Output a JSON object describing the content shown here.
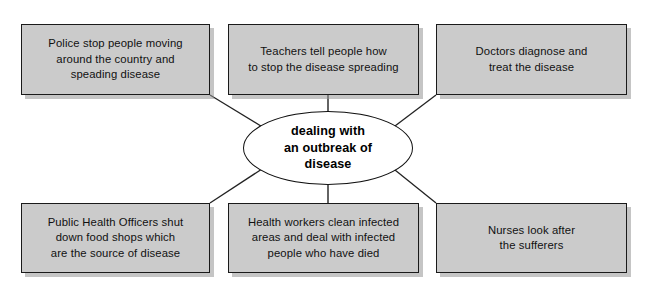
{
  "diagram": {
    "title": "dealing with an outbreak of disease",
    "type": "spider-diagram",
    "center": {
      "label": "dealing with\nan outbreak of\ndisease"
    },
    "colors": {
      "box_fill": "#cbcbcb",
      "box_border": "#1a1a1a",
      "center_fill": "#ffffff",
      "connector": "#222222",
      "page_background": "#ffffff",
      "shadow": "#969696"
    },
    "nodes": [
      {
        "id": "police",
        "label": "Police stop people moving\naround the country and\nspeading disease",
        "position": "top-left"
      },
      {
        "id": "teachers",
        "label": "Teachers tell people how\nto stop the disease spreading",
        "position": "top-center"
      },
      {
        "id": "doctors",
        "label": "Doctors diagnose and\ntreat the disease",
        "position": "top-right"
      },
      {
        "id": "public-health-officers",
        "label": "Public Health Officers shut\ndown food shops which\nare the source of disease",
        "position": "bottom-left"
      },
      {
        "id": "health-workers",
        "label": "Health workers clean infected\nareas and deal with infected\npeople who have died",
        "position": "bottom-center"
      },
      {
        "id": "nurses",
        "label": "Nurses look after\nthe sufferers",
        "position": "bottom-right"
      }
    ]
  }
}
